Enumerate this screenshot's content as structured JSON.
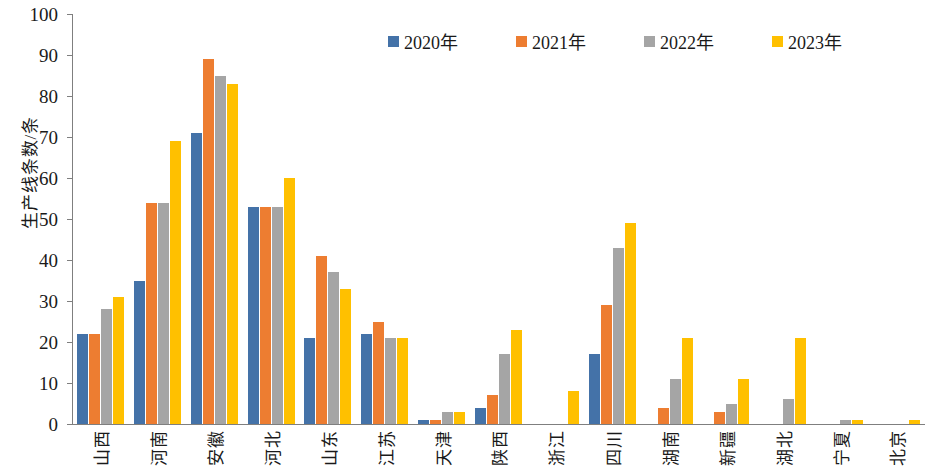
{
  "chart_data": {
    "type": "bar",
    "title": "",
    "xlabel": "",
    "ylabel": "生产线条数/条",
    "ylim": [
      0,
      100
    ],
    "ytick_step": 10,
    "yticks": [
      100,
      90,
      80,
      70,
      60,
      50,
      40,
      30,
      20,
      10,
      0
    ],
    "grid": false,
    "legend_position": "top-center",
    "categories": [
      "山西",
      "河南",
      "安徽",
      "河北",
      "山东",
      "江苏",
      "天津",
      "陕西",
      "浙江",
      "四川",
      "湖南",
      "新疆",
      "湖北",
      "宁夏",
      "北京"
    ],
    "series": [
      {
        "name": "2020年",
        "color": "#4472a8",
        "values": [
          22,
          35,
          71,
          53,
          21,
          22,
          1,
          4,
          0,
          17,
          0,
          0,
          0,
          0,
          0
        ]
      },
      {
        "name": "2021年",
        "color": "#ed7d31",
        "values": [
          22,
          54,
          89,
          53,
          41,
          25,
          1,
          7,
          0,
          29,
          4,
          3,
          0,
          0,
          0
        ]
      },
      {
        "name": "2022年",
        "color": "#a5a5a5",
        "values": [
          28,
          54,
          85,
          53,
          37,
          21,
          3,
          17,
          0,
          43,
          11,
          5,
          6,
          1,
          0
        ]
      },
      {
        "name": "2023年",
        "color": "#ffc000",
        "values": [
          31,
          69,
          83,
          60,
          33,
          21,
          3,
          23,
          8,
          49,
          21,
          11,
          21,
          1,
          1
        ]
      }
    ]
  },
  "legend": {
    "items": [
      {
        "label": "2020年",
        "color": "#4472a8"
      },
      {
        "label": "2021年",
        "color": "#ed7d31"
      },
      {
        "label": "2022年",
        "color": "#a5a5a5"
      },
      {
        "label": "2023年",
        "color": "#ffc000"
      }
    ]
  }
}
